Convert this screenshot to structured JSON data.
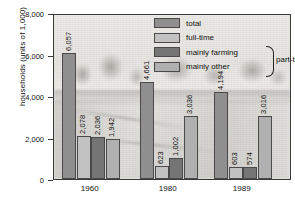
{
  "chart_data": {
    "type": "bar",
    "title": "",
    "xlabel": "",
    "ylabel": "households (units of 1,000)",
    "ylim": [
      0,
      8000
    ],
    "yticks": [
      "0",
      "2,000",
      "4,000",
      "6,000",
      "8,000"
    ],
    "ytick_values": [
      0,
      2000,
      4000,
      6000,
      8000
    ],
    "grid": false,
    "legend_position": "top-right",
    "categories": [
      "1960",
      "1980",
      "1989"
    ],
    "series": [
      {
        "name": "total",
        "values": [
          6057,
          4661,
          4194
        ],
        "color": "#8f8f8f"
      },
      {
        "name": "full-time",
        "values": [
          2078,
          623,
          603
        ],
        "color": "#c2c2c2"
      },
      {
        "name": "mainly farming",
        "values": [
          2036,
          1002,
          574
        ],
        "color": "#757575"
      },
      {
        "name": "mainly other",
        "values": [
          1942,
          3036,
          3016
        ],
        "color": "#b0b0b0"
      }
    ],
    "bar_labels": [
      [
        "6,057",
        "2,078",
        "2,036",
        "1,942"
      ],
      [
        "4,661",
        "623",
        "1,002",
        "3,036"
      ],
      [
        "4,194",
        "603",
        "574",
        "3,016"
      ]
    ],
    "annotations": [
      {
        "text": "part-time",
        "covers": [
          "mainly farming",
          "mainly other"
        ]
      }
    ]
  },
  "legend": {
    "items": [
      {
        "label": "total",
        "color": "#8f8f8f"
      },
      {
        "label": "full-time",
        "color": "#c2c2c2"
      },
      {
        "label": "mainly farming",
        "color": "#757575"
      },
      {
        "label": "mainly other",
        "color": "#b0b0b0"
      }
    ],
    "bracket_label": "part-time"
  }
}
